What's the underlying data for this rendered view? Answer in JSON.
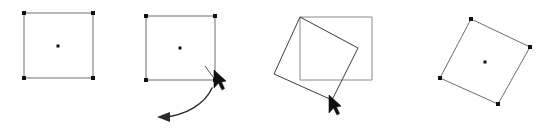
{
  "figure": {
    "title": "Rotate shape interaction sequence",
    "caption": "",
    "width": 555,
    "height": 128,
    "background": "#ffffff",
    "panel_count": 4
  },
  "colors": {
    "outline_light": "#6e6e6e",
    "outline_dark": "#3c3c3c",
    "ghost_outline": "#8a8a8a",
    "handle": "#111111",
    "center_dot": "#111111",
    "cursor": "#111111",
    "arc": "#2b2b2b",
    "background": "#ffffff"
  },
  "panels": [
    {
      "id": "panel-1",
      "name": "selected-square-unrotated",
      "step_label": "",
      "square": {
        "points": "24,13 93,13 93,78 24,78",
        "rotation_deg": 0
      },
      "center": {
        "x": 58,
        "y": 46
      },
      "handles": [
        {
          "x": 24,
          "y": 13,
          "name": "handle-top-left"
        },
        {
          "x": 93,
          "y": 13,
          "name": "handle-top-right"
        },
        {
          "x": 93,
          "y": 78,
          "name": "handle-bottom-right"
        },
        {
          "x": 24,
          "y": 78,
          "name": "handle-bottom-left"
        }
      ],
      "has_cursor": false,
      "has_arc": false
    },
    {
      "id": "panel-2",
      "name": "square-with-rotate-drag-gesture",
      "step_label": "",
      "square": {
        "points": "146,16 215,16 215,80 146,80",
        "rotation_deg": 0
      },
      "center": {
        "x": 180,
        "y": 48
      },
      "handles": [
        {
          "x": 146,
          "y": 16,
          "name": "handle-top-left"
        },
        {
          "x": 215,
          "y": 16,
          "name": "handle-top-right"
        },
        {
          "x": 215,
          "y": 80,
          "name": "handle-bottom-right"
        },
        {
          "x": 146,
          "y": 80,
          "name": "handle-bottom-left"
        }
      ],
      "has_cursor": true,
      "cursor": {
        "x": 214,
        "y": 77,
        "name": "mouse-pointer-on-rotate-handle"
      },
      "has_arc": true,
      "arc": {
        "path": "M 212 88 C 205 104 185 116 163 117",
        "head_points": "170,112 157,117 170,122",
        "direction": "counter-clockwise",
        "name": "rotation-direction-arrow"
      }
    },
    {
      "id": "panel-3",
      "name": "square-rotating-with-ghost-original",
      "step_label": "",
      "ghost_square": {
        "points": "300,17 372,17 372,80 300,80",
        "rotation_deg": 0,
        "name": "original-position-outline"
      },
      "square": {
        "points": "300,17 358,48 332,100 274,74",
        "rotation_deg": 28
      },
      "center": {
        "x": 316,
        "y": 58
      },
      "handles": [],
      "has_cursor": true,
      "cursor": {
        "x": 331,
        "y": 99,
        "name": "mouse-pointer-dragging-corner"
      },
      "has_arc": false
    },
    {
      "id": "panel-4",
      "name": "selected-square-rotated-result",
      "step_label": "",
      "square": {
        "points": "471,19 530,47 498,104 440,78",
        "rotation_deg": 28
      },
      "center": {
        "x": 485,
        "y": 62
      },
      "handles": [
        {
          "x": 471,
          "y": 19,
          "name": "handle-top"
        },
        {
          "x": 530,
          "y": 47,
          "name": "handle-right"
        },
        {
          "x": 498,
          "y": 104,
          "name": "handle-bottom"
        },
        {
          "x": 440,
          "y": 78,
          "name": "handle-left"
        }
      ],
      "has_cursor": false,
      "has_arc": false
    }
  ],
  "geometry": {
    "handle_size": 4,
    "center_dot_size": 3
  }
}
